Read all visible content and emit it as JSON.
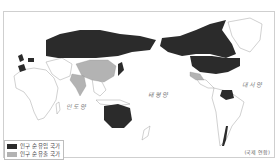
{
  "map": {
    "projection": "Pacific-centered world map",
    "colors": {
      "inflow": "#2b2b2b",
      "outflow": "#b3b3b3",
      "neutral": "#ffffff",
      "border": "#8a8a8a"
    },
    "oceans": [
      {
        "label": "인도양"
      },
      {
        "label": "태평양"
      },
      {
        "label": "대서양"
      }
    ],
    "legend": {
      "items": [
        {
          "label": "인구 순 유입 국가",
          "color": "#2b2b2b"
        },
        {
          "label": "인구 순 유출 국가",
          "color": "#b3b3b3"
        }
      ]
    },
    "source": "(국제 연합)",
    "inflow_regions": [
      "Russia",
      "Canada",
      "United States",
      "Australia",
      "Venezuela",
      "Western Europe",
      "Japan",
      "Chile"
    ],
    "outflow_regions": [
      "China",
      "India",
      "Mexico",
      "Colombia"
    ]
  }
}
